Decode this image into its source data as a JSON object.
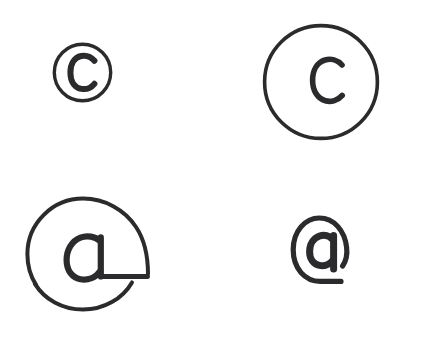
{
  "canvas": {
    "width": 429,
    "height": 340,
    "background_color": "#ffffff",
    "stroke_color": "#2b2b2d",
    "description": "Four hand-drawn symbol sketches on a plain white canvas: a copyright sign, a circled letter c, a large open-ring at sign, and a bold at sign."
  },
  "glyphs": [
    {
      "id": "copyright-sign",
      "label": "©",
      "character_name": "copyright-sign",
      "inner_letter": "C",
      "position": {
        "x": 51,
        "y": 41
      },
      "size": {
        "width": 63,
        "height": 63
      },
      "outer_diameter": 59,
      "outer_stroke_width": 3.4,
      "inner_stroke_width": 6.0,
      "ring_closed": true,
      "stroke_color": "#2b2b2d"
    },
    {
      "id": "circled-c",
      "label": "ⓒ",
      "character_name": "circled-latin-small-letter-c",
      "inner_letter": "c",
      "position": {
        "x": 262,
        "y": 23
      },
      "size": {
        "width": 118,
        "height": 118
      },
      "outer_diameter": 113,
      "outer_stroke_width": 3.6,
      "inner_stroke_width": 5.6,
      "ring_closed": true,
      "stroke_color": "#2b2b2d"
    },
    {
      "id": "open-ring-at-sign",
      "label": "@",
      "character_name": "commercial-at-open-ring",
      "inner_letter": "a",
      "position": {
        "x": 24,
        "y": 194
      },
      "size": {
        "width": 128,
        "height": 120
      },
      "outer_diameter": 114,
      "outer_stroke_width": 4.0,
      "inner_stroke_width": 6.2,
      "ring_closed": false,
      "ring_gap_note": "outer ring interrupted on the lower right where the letter tail exits",
      "stroke_color": "#2b2b2d"
    },
    {
      "id": "bold-at-sign",
      "label": "@",
      "character_name": "commercial-at",
      "inner_letter": "a",
      "position": {
        "x": 290,
        "y": 214
      },
      "size": {
        "width": 64,
        "height": 72
      },
      "outer_diameter": 60,
      "outer_stroke_width": 5.2,
      "inner_stroke_width": 7.0,
      "ring_closed": false,
      "ring_gap_note": "outer ring open at the lower right, tail sweeps out and down",
      "stroke_color": "#2b2b2d"
    }
  ]
}
